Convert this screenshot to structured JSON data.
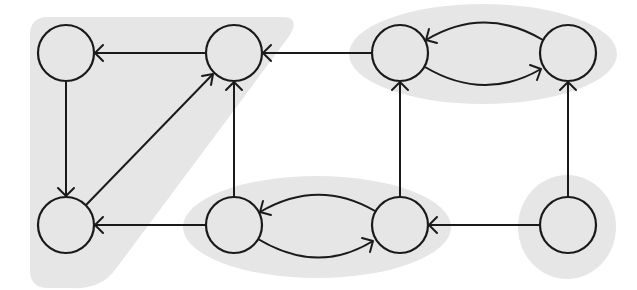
{
  "diagram": {
    "type": "directed-graph",
    "colors": {
      "component_fill": "#e6e6e6",
      "stroke": "#1a1a1a",
      "background": "#ffffff"
    },
    "node_radius": 28,
    "nodes": [
      {
        "id": "n1",
        "label": "",
        "cx": 66,
        "cy": 53
      },
      {
        "id": "n2",
        "label": "",
        "cx": 234,
        "cy": 53
      },
      {
        "id": "n3",
        "label": "",
        "cx": 400,
        "cy": 53
      },
      {
        "id": "n4",
        "label": "",
        "cx": 568,
        "cy": 53
      },
      {
        "id": "n5",
        "label": "",
        "cx": 66,
        "cy": 225
      },
      {
        "id": "n6",
        "label": "",
        "cx": 234,
        "cy": 225
      },
      {
        "id": "n7",
        "label": "",
        "cx": 400,
        "cy": 225
      },
      {
        "id": "n8",
        "label": "",
        "cx": 568,
        "cy": 225
      }
    ],
    "edges": [
      {
        "from": "n2",
        "to": "n1",
        "shape": "straight"
      },
      {
        "from": "n1",
        "to": "n5",
        "shape": "straight"
      },
      {
        "from": "n5",
        "to": "n2",
        "shape": "straight"
      },
      {
        "from": "n3",
        "to": "n2",
        "shape": "straight"
      },
      {
        "from": "n6",
        "to": "n2",
        "shape": "straight"
      },
      {
        "from": "n6",
        "to": "n5",
        "shape": "straight"
      },
      {
        "from": "n4",
        "to": "n3",
        "shape": "curved-upper"
      },
      {
        "from": "n3",
        "to": "n4",
        "shape": "curved-lower"
      },
      {
        "from": "n7",
        "to": "n3",
        "shape": "straight"
      },
      {
        "from": "n8",
        "to": "n4",
        "shape": "straight"
      },
      {
        "from": "n7",
        "to": "n6",
        "shape": "curved-upper"
      },
      {
        "from": "n6",
        "to": "n7",
        "shape": "curved-lower"
      },
      {
        "from": "n8",
        "to": "n7",
        "shape": "straight"
      }
    ],
    "components": [
      {
        "id": "scc-left-triangle",
        "members": [
          "n1",
          "n2",
          "n5"
        ],
        "shape": "rounded-triangle"
      },
      {
        "id": "scc-top-right",
        "members": [
          "n3",
          "n4"
        ],
        "shape": "ellipse"
      },
      {
        "id": "scc-bottom-middle",
        "members": [
          "n6",
          "n7"
        ],
        "shape": "ellipse"
      },
      {
        "id": "scc-single",
        "members": [
          "n8"
        ],
        "shape": "circle"
      }
    ]
  }
}
